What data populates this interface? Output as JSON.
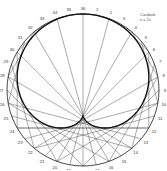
{
  "caption": {
    "line1": "Cardioid",
    "line2": "n = 2x"
  },
  "diagram": {
    "points": 36,
    "multiplier": 2,
    "labels": [
      "1",
      "2",
      "3",
      "4",
      "5",
      "6",
      "7",
      "8",
      "9",
      "10",
      "11",
      "12",
      "13",
      "14",
      "15",
      "16",
      "17",
      "18",
      "19",
      "20",
      "21",
      "22",
      "23",
      "24",
      "25",
      "26",
      "27",
      "28",
      "29",
      "30",
      "31",
      "32",
      "33",
      "34",
      "35",
      "36"
    ],
    "center": [
      83,
      90
    ],
    "radius": 76,
    "circle_color": "#333333",
    "chord_color": "#444444",
    "curve_color": "#111111"
  }
}
